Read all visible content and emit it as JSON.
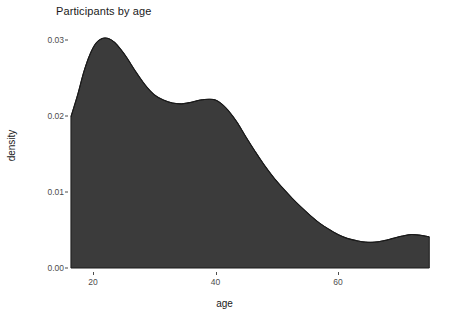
{
  "chart_data": {
    "type": "area",
    "title": "Participants by age",
    "xlabel": "age",
    "ylabel": "density",
    "xlim": [
      16.4,
      74.9
    ],
    "ylim": [
      0.0,
      0.0315
    ],
    "grid": false,
    "legend": "none",
    "x_ticks": [
      20,
      40,
      60
    ],
    "x_tick_labels": [
      "20",
      "40",
      "60"
    ],
    "y_ticks": [
      0.0,
      0.01,
      0.02,
      0.03
    ],
    "y_tick_labels": [
      "0.00",
      "0.01",
      "0.02",
      "0.03"
    ],
    "fill_color": "#3b3b3b",
    "line_color": "#1a1a1a",
    "background_color": "#ffffff",
    "series": [
      {
        "name": "density",
        "x": [
          16.4,
          17.5,
          18.5,
          19.5,
          20.5,
          21.5,
          22.5,
          23.5,
          24.5,
          25.5,
          27.0,
          28.5,
          30.0,
          31.5,
          33.0,
          34.5,
          36.0,
          37.5,
          39.0,
          40.0,
          41.0,
          42.0,
          43.5,
          45.0,
          46.5,
          48.0,
          49.5,
          51.0,
          52.5,
          54.0,
          55.5,
          57.0,
          58.5,
          60.0,
          61.5,
          63.0,
          64.5,
          66.0,
          67.5,
          69.0,
          70.5,
          72.0,
          73.5,
          74.9
        ],
        "y": [
          0.0199,
          0.0228,
          0.0258,
          0.0281,
          0.0296,
          0.0302,
          0.0302,
          0.0297,
          0.0288,
          0.0277,
          0.0258,
          0.0241,
          0.0228,
          0.0221,
          0.0217,
          0.0216,
          0.0218,
          0.0221,
          0.0222,
          0.0221,
          0.0216,
          0.0208,
          0.0192,
          0.0172,
          0.0153,
          0.0135,
          0.0119,
          0.0105,
          0.0092,
          0.008,
          0.0069,
          0.0059,
          0.0051,
          0.0044,
          0.0039,
          0.0036,
          0.0034,
          0.0034,
          0.0036,
          0.0039,
          0.0042,
          0.0044,
          0.0043,
          0.0041
        ]
      }
    ]
  },
  "chart": {
    "title": "Participants by age",
    "x_axis_label": "age",
    "y_axis_label": "density"
  }
}
